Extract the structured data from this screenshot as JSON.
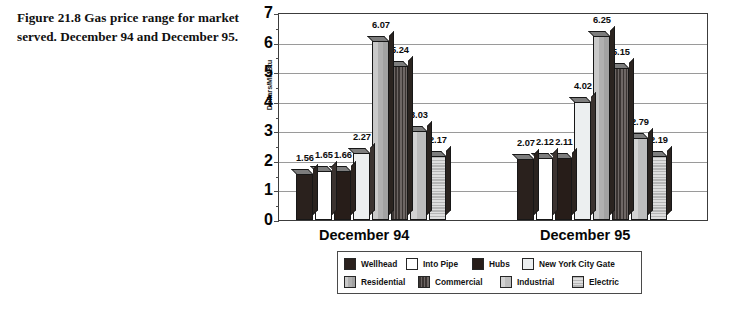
{
  "caption": {
    "text": "Figure 21.8 Gas price range for market served. December 94 and December 95."
  },
  "chart_data": {
    "type": "bar",
    "title": "",
    "subtitle": "",
    "xlabel": "",
    "ylabel": "Dollars/MMBtu",
    "ylim": [
      0,
      7
    ],
    "ytick_labels": [
      "0",
      "1",
      "2",
      "3",
      "4",
      "5",
      "6",
      "7"
    ],
    "grid": true,
    "legend_position": "bottom",
    "categories": [
      "December 94",
      "December 95"
    ],
    "series": [
      {
        "name": "Wellhead",
        "values": [
          1.56,
          2.07
        ],
        "swatch": "#2a211d"
      },
      {
        "name": "Into Pipe",
        "values": [
          1.65,
          2.12
        ],
        "swatch": "#ffffff"
      },
      {
        "name": "Hubs",
        "values": [
          1.66,
          2.11
        ],
        "swatch": "#271d19"
      },
      {
        "name": "New York City Gate",
        "values": [
          2.27,
          4.02
        ],
        "swatch": "#eceff0"
      },
      {
        "name": "Residential",
        "values": [
          6.07,
          6.25
        ],
        "swatch": "#b6b6b6"
      },
      {
        "name": "Commercial",
        "values": [
          5.24,
          5.15
        ],
        "swatch": "#55504e"
      },
      {
        "name": "Industrial",
        "values": [
          3.03,
          2.79
        ],
        "swatch": "#c3c3c3"
      },
      {
        "name": "Electric",
        "values": [
          2.17,
          2.19
        ],
        "swatch": "#c9c9c9"
      }
    ],
    "data_labels": {
      "December 94": [
        "1.56",
        "1.65",
        "1.66",
        "2.27",
        "6.07",
        "5.24",
        "3.03",
        "2.17"
      ],
      "December 95": [
        "2.07",
        "2.12",
        "2.11",
        "4.02",
        "6.25",
        "5.15",
        "2.79",
        "2.19"
      ]
    }
  },
  "legend": {
    "row1": [
      "Wellhead",
      "Into Pipe",
      "Hubs",
      "New York City Gate"
    ],
    "row2": [
      "Residential",
      "Commercial",
      "Industrial",
      "Electric"
    ]
  }
}
